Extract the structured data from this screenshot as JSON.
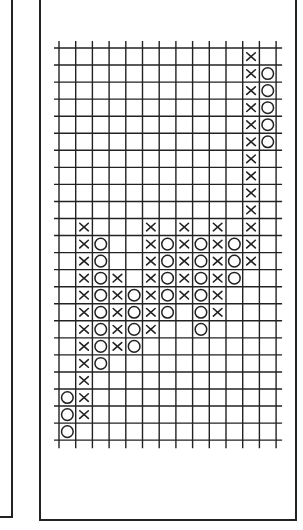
{
  "chart_data": {
    "type": "point-and-figure",
    "title": "",
    "xlabel": "",
    "ylabel": "",
    "grid": true,
    "legend": null,
    "num_columns": 13,
    "num_rows": 23,
    "row_index_note": "row 0 is the top box, row 22 the bottom box",
    "columns": [
      {
        "index": 0,
        "mark": "O",
        "rows": [
          20,
          21,
          22
        ]
      },
      {
        "index": 1,
        "mark": "X",
        "rows": [
          10,
          11,
          12,
          13,
          14,
          15,
          16,
          17,
          18,
          19,
          20,
          21
        ]
      },
      {
        "index": 2,
        "mark": "O",
        "rows": [
          11,
          12,
          13,
          14,
          15,
          16,
          17,
          18
        ]
      },
      {
        "index": 3,
        "mark": "X",
        "rows": [
          13,
          14,
          15,
          16,
          17
        ]
      },
      {
        "index": 4,
        "mark": "O",
        "rows": [
          14,
          15,
          16,
          17
        ]
      },
      {
        "index": 5,
        "mark": "X",
        "rows": [
          10,
          11,
          12,
          13,
          14,
          15,
          16
        ]
      },
      {
        "index": 6,
        "mark": "O",
        "rows": [
          11,
          12,
          13,
          14,
          15
        ]
      },
      {
        "index": 7,
        "mark": "X",
        "rows": [
          10,
          11,
          12,
          13,
          14
        ]
      },
      {
        "index": 8,
        "mark": "O",
        "rows": [
          11,
          12,
          13,
          14,
          15,
          16
        ]
      },
      {
        "index": 9,
        "mark": "X",
        "rows": [
          10,
          11,
          12,
          13,
          14,
          15
        ]
      },
      {
        "index": 10,
        "mark": "O",
        "rows": [
          11,
          12,
          13
        ]
      },
      {
        "index": 11,
        "mark": "X",
        "rows": [
          0,
          1,
          2,
          3,
          4,
          5,
          6,
          7,
          8,
          9,
          10,
          11,
          12
        ]
      },
      {
        "index": 12,
        "mark": "O",
        "rows": [
          1,
          2,
          3,
          4,
          5
        ]
      }
    ],
    "box_counts": [
      3,
      12,
      8,
      5,
      4,
      7,
      5,
      5,
      6,
      6,
      3,
      13,
      5
    ]
  },
  "layout": {
    "grid_left": 59,
    "grid_top": 48,
    "cell_w": 16.7,
    "cell_h": 17.05,
    "line_overhang_left": 5,
    "line_overhang_right": 6,
    "line_overhang_top": 7,
    "line_overhang_bottom": 8,
    "ink_color": "#222222"
  }
}
